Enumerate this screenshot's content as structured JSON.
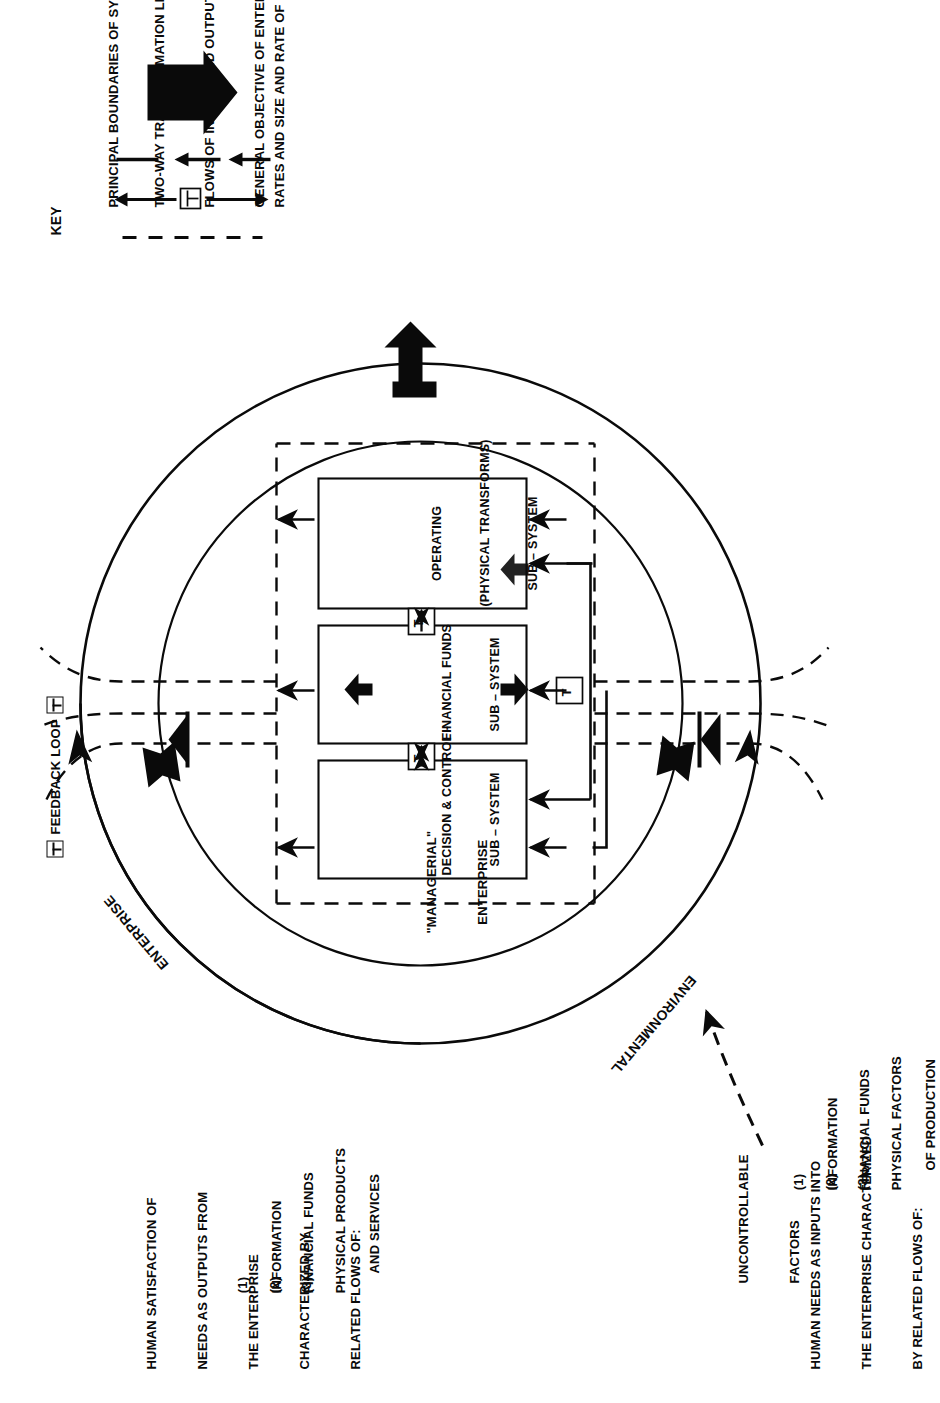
{
  "diagram": {
    "title_semantic": "enterprise-system-flow-diagram",
    "outputs_block": {
      "lines": [
        "HUMAN SATISFACTION OF",
        "NEEDS AS OUTPUTS FROM",
        "THE ENTERPRISE",
        "CHARACTERIZED BY",
        "RELATED FLOWS OF:"
      ],
      "items": [
        {
          "num": "(1)",
          "label": "INFORMATION"
        },
        {
          "num": "(2)",
          "label": "FINANCIAL FUNDS"
        },
        {
          "num": "(3)",
          "label": "PHYSICAL PRODUCTS",
          "label2": "AND SERVICES"
        }
      ]
    },
    "inputs_block": {
      "lines": [
        "HUMAN NEEDS AS INPUTS INTO",
        "THE ENTERPRISE CHARACTERIZED",
        "BY RELATED FLOWS OF:"
      ],
      "items": [
        {
          "num": "(1)",
          "label": "INFORMATION"
        },
        {
          "num": "(2)",
          "label": "FINANCIAL FUNDS"
        },
        {
          "num": "(3)",
          "label": "PHYSICAL FACTORS",
          "label2": "OF PRODUCTION"
        }
      ]
    },
    "uncontrollable": {
      "line1": "UNCONTROLLABLE",
      "line2": "FACTORS"
    },
    "ring_labels": {
      "outer": "ENTERPRISE",
      "inner_bottom": "ENVIRONMENTAL",
      "managerial_line1": "\"MANAGERIAL\"",
      "managerial_line2": "ENTERPRISE",
      "feedback_loop": "FEEDBACK LOOP"
    },
    "subsystems": [
      {
        "line1": "DECISION & CONTROL -",
        "line2": "SUB – SYSTEM"
      },
      {
        "line1": "FINANCIAL FUNDS",
        "line2": "SUB – SYSTEM"
      },
      {
        "line1": "OPERATING",
        "line2": "(PHYSICAL TRANSFORMS)",
        "line3": "SUB – SYSTEM"
      }
    ],
    "filter_symbol": "T"
  },
  "key": {
    "title": "KEY",
    "entries": [
      {
        "symbol": "dashed-line",
        "text": "PRINCIPAL BOUNDARIES OF SYSTEM'S ANALYSIS, WITH BREAKS REPRESENTING FILTERS"
      },
      {
        "symbol": "two-way-arrow-with-filter",
        "text": "TWO-WAY TRANSFORMATION LINKAGES BETWEEN DIFFERENT CHARACTERIZATIONS OF SYSTEM"
      },
      {
        "symbol": "solid-line-and-arrows",
        "text": "FLOWS OF INPUTS AND OUTPUTS MEASURED IN TERMS OF VARIOUS CHARACTERISTICS"
      },
      {
        "symbol": "thick-block-arrow",
        "text": "GENERAL OBJECTIVE OF ENTERPRISE, VIZ LONG-RUN SURVIVAL BY MEANS OF SPECIFIED GROWTH",
        "text2": "RATES AND SIZE AND RATE OF PROFITABILITY"
      }
    ]
  },
  "colors": {
    "ink": "#0a0a0a",
    "paper": "#ffffff"
  }
}
